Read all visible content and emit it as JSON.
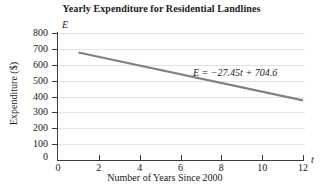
{
  "chart_data": {
    "type": "line",
    "title": "Yearly Expenditure for Residential Landlines",
    "xlabel": "Number of Years Since 2000",
    "ylabel": "Expenditure ($)",
    "x_variable": "E",
    "y_variable": "t",
    "xlim": [
      0,
      12
    ],
    "ylim": [
      0,
      800
    ],
    "xticks": [
      0,
      2,
      4,
      6,
      8,
      10,
      12
    ],
    "xtick_labels": [
      "0",
      "2",
      "4",
      "6",
      "8",
      "10",
      "12"
    ],
    "yticks": [
      0,
      100,
      200,
      300,
      400,
      500,
      600,
      700,
      800
    ],
    "ytick_labels": [
      "0",
      "100",
      "200",
      "300",
      "400",
      "500",
      "600",
      "700",
      "800"
    ],
    "grid": "horizontal",
    "legend": "none",
    "annotation": "E = −27.45t + 704.6",
    "equation": {
      "slope": -27.45,
      "intercept": 704.6
    },
    "series": [
      {
        "name": "Yearly expenditure trend line",
        "color": "#808080",
        "x": [
          1,
          12
        ],
        "values": [
          677.15,
          375.2
        ]
      }
    ]
  },
  "axis_labels": {
    "y_variable": "E",
    "x_variable": "t"
  },
  "colors": {
    "line": "#8a8a8a",
    "axis": "#3a3a3a",
    "grid": "#e2e2e2",
    "text": "#1a1a1a",
    "background": "#ffffff"
  }
}
